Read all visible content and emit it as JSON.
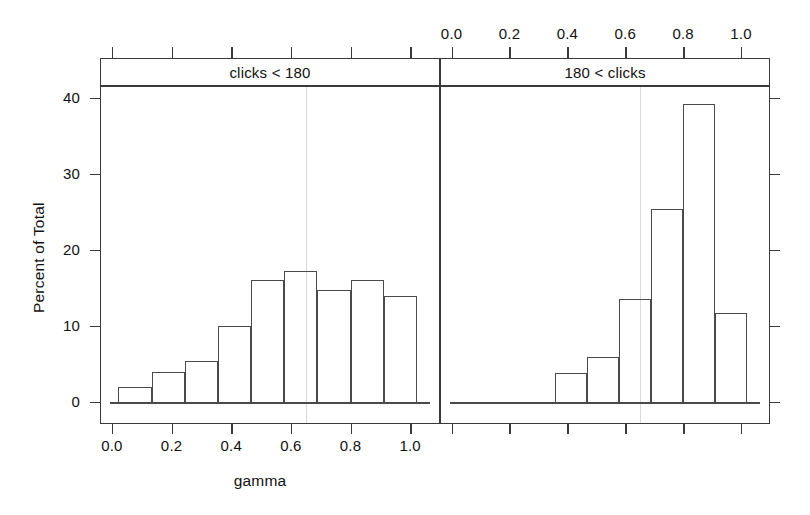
{
  "chart_data": {
    "type": "bar",
    "subtype": "histogram-trellis",
    "title": "",
    "xlabel": "gamma",
    "ylabel": "Percent of Total",
    "xlim": [
      -0.04,
      1.1
    ],
    "ylim": [
      -2.5,
      43.5
    ],
    "grid": "vertical reference line at gamma 0.65 in each panel",
    "legend": "none",
    "axis_note": "x tick labels shown on bottom axis of left panel and top axis of right panel; y tick labels on left axis; mirrored unlabeled ticks on opposite sides",
    "xticks": [
      0.0,
      0.2,
      0.4,
      0.6,
      0.8,
      1.0
    ],
    "xtick_labels": [
      "0.0",
      "0.2",
      "0.4",
      "0.6",
      "0.8",
      "1.0"
    ],
    "yticks": [
      0,
      10,
      20,
      30,
      40
    ],
    "ytick_labels": [
      "0",
      "10",
      "20",
      "30",
      "40"
    ],
    "panels": [
      {
        "strip_label": "clicks < 180",
        "bin_width": 0.111,
        "bin_starts": [
          0.022,
          0.133,
          0.244,
          0.356,
          0.467,
          0.578,
          0.689,
          0.8,
          0.911
        ],
        "bin_centers": [
          0.078,
          0.189,
          0.3,
          0.411,
          0.522,
          0.633,
          0.744,
          0.856,
          0.967
        ],
        "values": [
          2.0,
          4.0,
          5.4,
          10.0,
          16.0,
          17.3,
          14.8,
          16.0,
          14.0
        ]
      },
      {
        "strip_label": "180 < clicks",
        "bin_width": 0.111,
        "bin_starts": [
          0.356,
          0.467,
          0.578,
          0.689,
          0.8,
          0.911
        ],
        "bin_centers": [
          0.411,
          0.522,
          0.633,
          0.744,
          0.856,
          0.967
        ],
        "values": [
          3.8,
          5.9,
          13.6,
          25.4,
          39.2,
          11.7
        ]
      }
    ]
  },
  "axes": {
    "x_title": "gamma",
    "y_title": "Percent of Total"
  },
  "strips": {
    "left": "clicks < 180",
    "right": "180 < clicks"
  },
  "colors": {
    "bar_stroke": "#4a4a4a",
    "frame": "#3a3a3a",
    "text": "#111111",
    "gridline": "#d8d8d8",
    "background": "#ffffff"
  }
}
